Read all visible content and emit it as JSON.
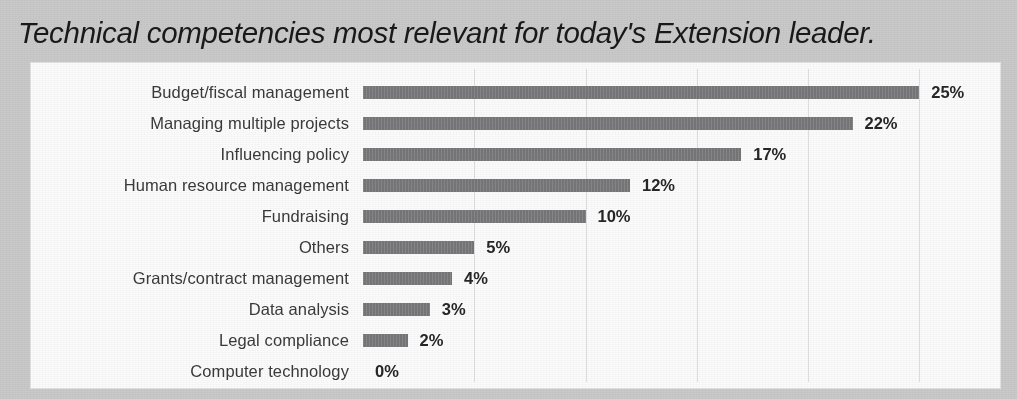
{
  "chart_data": {
    "type": "bar",
    "orientation": "horizontal",
    "title": "Technical competencies most relevant for today's Extension leader.",
    "xlabel": "",
    "ylabel": "",
    "xlim": [
      0,
      30
    ],
    "grid": true,
    "gridlines_at": [
      5,
      10,
      15,
      20,
      25,
      30
    ],
    "legend": "none",
    "value_suffix": "%",
    "categories": [
      "Budget/fiscal management",
      "Managing multiple projects",
      "Influencing policy",
      "Human resource management",
      "Fundraising",
      "Others",
      "Grants/contract management",
      "Data analysis",
      "Legal compliance",
      "Computer technology"
    ],
    "values": [
      25,
      22,
      17,
      12,
      10,
      5,
      4,
      3,
      2,
      0
    ],
    "value_labels": [
      "25%",
      "22%",
      "17%",
      "12%",
      "10%",
      "5%",
      "4%",
      "3%",
      "2%",
      "0%"
    ],
    "bar_color": "#7b7b7d",
    "plot_background": "#fbfbfb",
    "figure_background": "#c9c9c9",
    "gridline_color": "#dedede",
    "text_color": "#3a3a3c"
  }
}
